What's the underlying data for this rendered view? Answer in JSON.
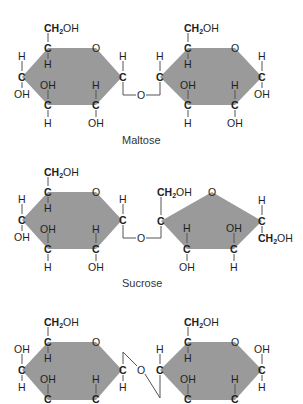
{
  "diagram": {
    "type": "disaccharide-structures",
    "colors": {
      "ring_fill": "#9a9a9a",
      "text": "#1e1e1e",
      "bond": "#555555",
      "background": "#ffffff"
    },
    "molecules": [
      {
        "name": "Maltose",
        "rings": [
          "glucose (pyranose, hexagon)",
          "glucose (pyranose, hexagon)"
        ],
        "linkage": "O bridge between right C of ring 1 and left C of ring 2 (below)"
      },
      {
        "name": "Sucrose",
        "rings": [
          "glucose (pyranose, hexagon)",
          "fructose (furanose, pentagon)"
        ],
        "linkage": "O bridge between right C of glucose and left C of fructose (below)"
      },
      {
        "name": "",
        "rings": [
          "glucose (pyranose, hexagon)",
          "glucose (pyranose, hexagon)"
        ],
        "linkage": "O bridge drawn diagonally between right C of ring 1 and left C of ring 2",
        "note": "third structure cropped at bottom edge, label not visible"
      }
    ],
    "labels": {
      "maltose": "Maltose",
      "sucrose": "Sucrose"
    },
    "atoms": {
      "C": "C",
      "O": "O",
      "H": "H",
      "OH": "OH",
      "CH2OH_main": "CH",
      "CH2OH_sub": "2",
      "CH2OH_tail": "OH"
    }
  }
}
